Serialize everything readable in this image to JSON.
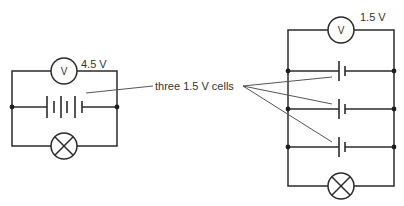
{
  "diagram": {
    "type": "circuit",
    "left_circuit": {
      "voltmeter_symbol": "V",
      "voltmeter_reading": "4.5 V",
      "cells_arrangement": "series",
      "cell_count": 3,
      "components": [
        "voltmeter-icon",
        "battery-series-icon",
        "lamp-icon"
      ]
    },
    "right_circuit": {
      "voltmeter_symbol": "V",
      "voltmeter_reading": "1.5 V",
      "cells_arrangement": "parallel",
      "cell_count": 3,
      "components": [
        "voltmeter-icon",
        "cell-icon",
        "cell-icon",
        "cell-icon",
        "lamp-icon"
      ]
    },
    "callout_label": "three 1.5 V cells",
    "colors": {
      "wire": "#2b2b2b",
      "leader": "#555555",
      "background": "#ffffff"
    }
  }
}
